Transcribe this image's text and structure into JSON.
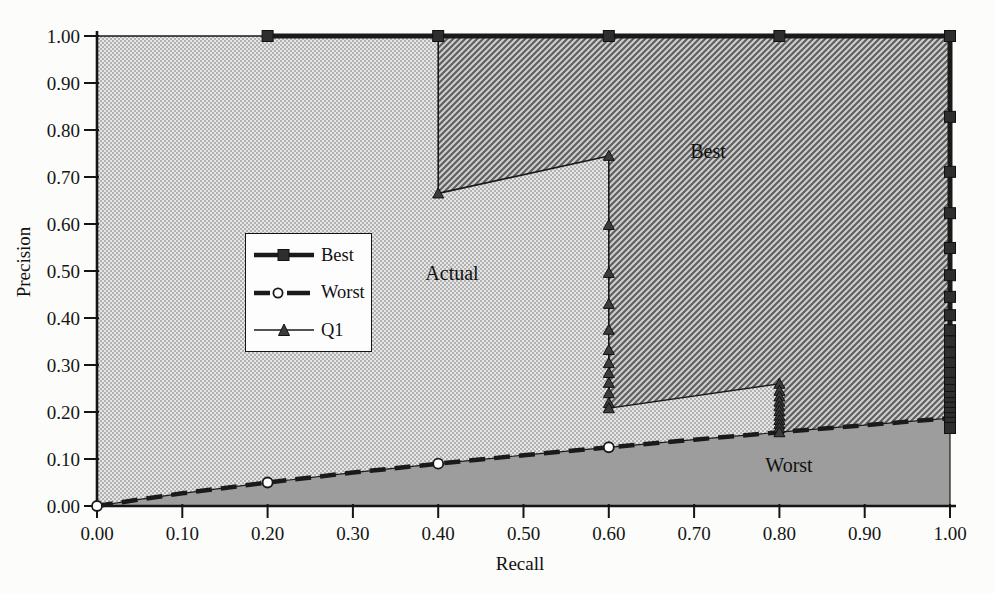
{
  "figure": {
    "xlabel": "Recall",
    "ylabel": "Precision"
  },
  "legend": {
    "items": [
      {
        "label": "Best",
        "marker": "filled-square",
        "line": "thick-solid"
      },
      {
        "label": "Worst",
        "marker": "open-circle",
        "line": "thick-dashed"
      },
      {
        "label": "Q1",
        "marker": "filled-triangle",
        "line": "thin-solid"
      }
    ]
  },
  "region_labels": {
    "best": "Best",
    "actual": "Actual",
    "worst": "Worst"
  },
  "colors": {
    "line": "#1a1a1a",
    "stipple_light": "#e6e6e6",
    "stipple_dark": "#b2b2b2",
    "hatch_bg": "#cdcdcd",
    "hatch_line": "#5e5e5e",
    "worst_fill": "#9d9d9d",
    "marker_fill": "#2e2e2e"
  },
  "chart_data": {
    "type": "line",
    "title": "",
    "xlabel": "Recall",
    "ylabel": "Precision",
    "xlim": [
      0,
      1
    ],
    "ylim": [
      0,
      1
    ],
    "grid": false,
    "legend_position": "inside-middle-left",
    "x_ticks": [
      "0.00",
      "0.10",
      "0.20",
      "0.30",
      "0.40",
      "0.50",
      "0.60",
      "0.70",
      "0.80",
      "0.90",
      "1.00"
    ],
    "y_ticks": [
      "0.00",
      "0.10",
      "0.20",
      "0.30",
      "0.40",
      "0.50",
      "0.60",
      "0.70",
      "0.80",
      "0.90",
      "1.00"
    ],
    "series": [
      {
        "name": "Best",
        "line_style": "thick-solid",
        "marker": "filled-square",
        "line_points": [
          [
            0.195,
            1
          ],
          [
            1,
            1
          ],
          [
            1,
            0.166
          ]
        ],
        "marker_points": [
          [
            0.2,
            1
          ],
          [
            0.4,
            1
          ],
          [
            0.6,
            1
          ],
          [
            0.8,
            1
          ],
          [
            1,
            1
          ],
          [
            1,
            0.828
          ],
          [
            1,
            0.711
          ],
          [
            1,
            0.623
          ],
          [
            1,
            0.549
          ],
          [
            1,
            0.491
          ],
          [
            1,
            0.445
          ],
          [
            1,
            0.406
          ],
          [
            1,
            0.374
          ],
          [
            1,
            0.35
          ],
          [
            1,
            0.326
          ],
          [
            1,
            0.304
          ],
          [
            1,
            0.283
          ],
          [
            1,
            0.262
          ],
          [
            1,
            0.247
          ],
          [
            1,
            0.232
          ],
          [
            1,
            0.219
          ],
          [
            1,
            0.209
          ],
          [
            1,
            0.198
          ],
          [
            1,
            0.187
          ],
          [
            1,
            0.177
          ],
          [
            1,
            0.166
          ]
        ]
      },
      {
        "name": "Worst",
        "line_style": "thick-dashed",
        "marker": "open-circle",
        "line_points": [
          [
            0,
            0
          ],
          [
            0.05,
            0.014
          ],
          [
            0.1,
            0.027
          ],
          [
            0.2,
            0.05
          ],
          [
            0.3,
            0.071
          ],
          [
            0.4,
            0.09
          ],
          [
            0.5,
            0.108
          ],
          [
            0.6,
            0.125
          ],
          [
            0.7,
            0.141
          ],
          [
            0.8,
            0.157
          ],
          [
            0.9,
            0.172
          ],
          [
            1,
            0.187
          ]
        ],
        "marker_points": [
          [
            0,
            0
          ],
          [
            0.2,
            0.05
          ],
          [
            0.4,
            0.09
          ],
          [
            0.6,
            0.125
          ]
        ]
      },
      {
        "name": "Q1",
        "line_style": "thin-solid",
        "marker": "filled-triangle",
        "line_points": [
          [
            0,
            1
          ],
          [
            0.4,
            1
          ],
          [
            0.4,
            0.665
          ],
          [
            0.6,
            0.745
          ],
          [
            0.6,
            0.208
          ],
          [
            0.8,
            0.26
          ],
          [
            0.8,
            0.157
          ]
        ],
        "marker_points": [
          [
            0.4,
            0.665
          ],
          [
            0.6,
            0.745
          ],
          [
            0.6,
            0.598
          ],
          [
            0.6,
            0.496
          ],
          [
            0.6,
            0.43
          ],
          [
            0.6,
            0.375
          ],
          [
            0.6,
            0.332
          ],
          [
            0.6,
            0.304
          ],
          [
            0.6,
            0.283
          ],
          [
            0.6,
            0.262
          ],
          [
            0.6,
            0.24
          ],
          [
            0.6,
            0.219
          ],
          [
            0.6,
            0.208
          ],
          [
            0.8,
            0.26
          ],
          [
            0.8,
            0.245
          ],
          [
            0.8,
            0.233
          ],
          [
            0.8,
            0.222
          ],
          [
            0.8,
            0.212
          ],
          [
            0.8,
            0.202
          ],
          [
            0.8,
            0.192
          ],
          [
            0.8,
            0.183
          ],
          [
            0.8,
            0.174
          ],
          [
            0.8,
            0.166
          ],
          [
            0.8,
            0.157
          ]
        ]
      }
    ],
    "regions": [
      {
        "label": "Actual",
        "fill": "stipple",
        "points": [
          [
            0,
            1
          ],
          [
            0.4,
            1
          ],
          [
            0.4,
            0.665
          ],
          [
            0.6,
            0.745
          ],
          [
            0.6,
            0.208
          ],
          [
            0.8,
            0.26
          ],
          [
            0.8,
            0.157
          ],
          [
            0.7,
            0.141
          ],
          [
            0.6,
            0.125
          ],
          [
            0.5,
            0.108
          ],
          [
            0.4,
            0.09
          ],
          [
            0.3,
            0.071
          ],
          [
            0.2,
            0.05
          ],
          [
            0.1,
            0.027
          ],
          [
            0.05,
            0.014
          ],
          [
            0,
            0
          ]
        ]
      },
      {
        "label": "Best",
        "fill": "hatch",
        "points": [
          [
            0.4,
            1
          ],
          [
            1,
            1
          ],
          [
            1,
            0.187
          ],
          [
            0.9,
            0.172
          ],
          [
            0.8,
            0.157
          ],
          [
            0.8,
            0.26
          ],
          [
            0.6,
            0.208
          ],
          [
            0.6,
            0.745
          ],
          [
            0.4,
            0.665
          ]
        ]
      },
      {
        "label": "Worst",
        "fill": "gray",
        "points": [
          [
            0,
            0
          ],
          [
            0.05,
            0.014
          ],
          [
            0.1,
            0.027
          ],
          [
            0.2,
            0.05
          ],
          [
            0.3,
            0.071
          ],
          [
            0.4,
            0.09
          ],
          [
            0.5,
            0.108
          ],
          [
            0.6,
            0.125
          ],
          [
            0.7,
            0.141
          ],
          [
            0.8,
            0.157
          ],
          [
            0.9,
            0.172
          ],
          [
            1,
            0.187
          ],
          [
            1,
            0
          ],
          [
            0,
            0
          ]
        ]
      }
    ],
    "plot_area_px": {
      "x0": 97,
      "x1": 950,
      "y0": 506,
      "y1": 36
    }
  }
}
